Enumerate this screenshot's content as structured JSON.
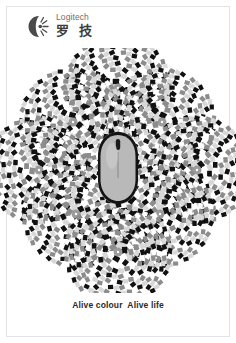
{
  "page": {
    "background_color": "#ffffff",
    "frame_color": "#e3e3e3",
    "width": 236,
    "height": 343
  },
  "brand": {
    "mark_icon": "logitech-c-sunburst-icon",
    "latin_name": "Logitech",
    "cjk_name": "罗 技",
    "latin_color": "#6e6e6e",
    "cjk_color": "#3d3d3d"
  },
  "artwork": {
    "name": "rotating-snakes-optical-illusion-flower",
    "description": "Seven overlapping peripheral-drift illusion discs arranged as a flower, with a computer mouse at the centre",
    "petal_count": 7,
    "disc_radius": 52,
    "ring_count": 9,
    "block_colors": [
      "#111111",
      "#ffffff",
      "#8c8c8c",
      "#d8d8d8"
    ],
    "petals": [
      {
        "label": "top",
        "cx": 118,
        "cy": 40
      },
      {
        "label": "upper-left",
        "cx": 73,
        "cy": 74
      },
      {
        "label": "upper-right",
        "cx": 162,
        "cy": 74
      },
      {
        "label": "left",
        "cx": 39,
        "cy": 122
      },
      {
        "label": "right",
        "cx": 197,
        "cy": 122
      },
      {
        "label": "lower-left",
        "cx": 76,
        "cy": 166
      },
      {
        "label": "lower-right",
        "cx": 160,
        "cy": 166
      },
      {
        "label": "bottom",
        "cx": 118,
        "cy": 204
      }
    ],
    "mouse": {
      "name": "computer-mouse",
      "cx": 118,
      "cy": 122,
      "body_color": "#b9b9b9",
      "outline_color": "#141414",
      "wheel_color": "#1c1c1c"
    }
  },
  "tagline": {
    "text": "Alive colour  Alive life",
    "color": "#2b2b2b"
  }
}
